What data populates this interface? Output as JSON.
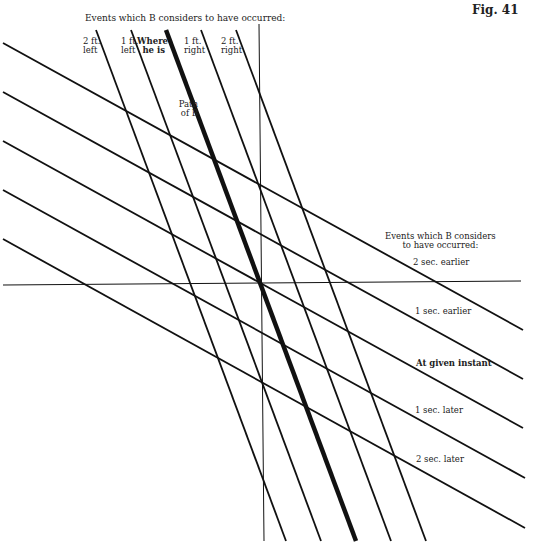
{
  "figure": {
    "label": "Fig. 41"
  },
  "top_header": "Events which B considers to have occurred:",
  "position_labels": [
    {
      "line1": "2 ft.",
      "line2": "left"
    },
    {
      "line1": "1 ft.",
      "line2": "left"
    },
    {
      "line1": "Where",
      "line2": "he is"
    },
    {
      "line1": "1 ft.",
      "line2": "right"
    },
    {
      "line1": "2 ft.",
      "line2": "right"
    }
  ],
  "path_label": {
    "line1": "Path",
    "line2": "of B"
  },
  "right_header": {
    "line1": "Events which B considers",
    "line2": "to have occurred:"
  },
  "time_labels": [
    "2 sec. earlier",
    "1 sec. earlier",
    "At given instant",
    "1 sec. later",
    "2 sec. later"
  ],
  "colors": {
    "ink": "#111111",
    "background": "#ffffff"
  },
  "chart_data": {
    "type": "diagram",
    "title": "Fig. 41",
    "axes": {
      "time_axis": {
        "x1": 259,
        "y1": 24,
        "x2": 264,
        "y2": 541
      },
      "space_axis": {
        "x1": 3,
        "y1": 285,
        "x2": 521,
        "y2": 281
      }
    },
    "simultaneity_lines": [
      {
        "label": "2 sec. earlier",
        "x1": 3,
        "y1": 43,
        "x2": 523,
        "y2": 330
      },
      {
        "label": "1 sec. earlier",
        "x1": 3,
        "y1": 92,
        "x2": 523,
        "y2": 379
      },
      {
        "label": "At given instant",
        "x1": 3,
        "y1": 141,
        "x2": 523,
        "y2": 428
      },
      {
        "label": "1 sec. later",
        "x1": 3,
        "y1": 190,
        "x2": 525,
        "y2": 478
      },
      {
        "label": "2 sec. later",
        "x1": 3,
        "y1": 239,
        "x2": 525,
        "y2": 528
      }
    ],
    "position_lines": [
      {
        "label": "2 ft. left",
        "x1": 96,
        "y1": 30,
        "x2": 286,
        "y2": 541,
        "bold": false
      },
      {
        "label": "1 ft. left",
        "x1": 131,
        "y1": 30,
        "x2": 321,
        "y2": 541,
        "bold": false
      },
      {
        "label": "Where he is (Path of B)",
        "x1": 166,
        "y1": 30,
        "x2": 356,
        "y2": 541,
        "bold": true
      },
      {
        "label": "1 ft. right",
        "x1": 201,
        "y1": 30,
        "x2": 391,
        "y2": 541,
        "bold": false
      },
      {
        "label": "2 ft. right",
        "x1": 236,
        "y1": 30,
        "x2": 426,
        "y2": 541,
        "bold": false
      }
    ]
  }
}
